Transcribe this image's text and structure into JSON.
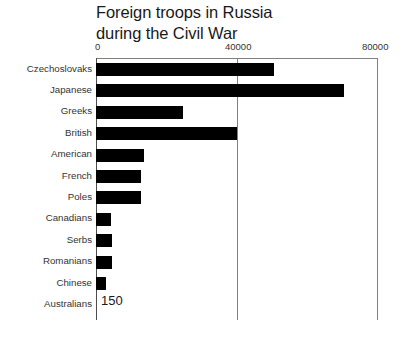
{
  "chart_data": {
    "type": "bar",
    "orientation": "horizontal",
    "title": "Foreign troops in Russia\nduring the Civil War",
    "xlabel": "",
    "ylabel": "",
    "xlim": [
      0,
      80000
    ],
    "xticks": [
      0,
      40000,
      80000
    ],
    "xtick_labels": [
      "0",
      "40000",
      "80000"
    ],
    "grid": "vertical-at-ticks",
    "legend": "none",
    "bar_color": "#000000",
    "categories": [
      "Czechoslovaks",
      "Japanese",
      "Greeks",
      "British",
      "American",
      "French",
      "Poles",
      "Canadians",
      "Serbs",
      "Romanians",
      "Chinese",
      "Australians"
    ],
    "values": [
      50500,
      70400,
      24600,
      40000,
      13600,
      12800,
      12800,
      4300,
      4500,
      4500,
      2800,
      150
    ],
    "annotations": [
      {
        "category": "Australians",
        "text": "150"
      }
    ]
  }
}
